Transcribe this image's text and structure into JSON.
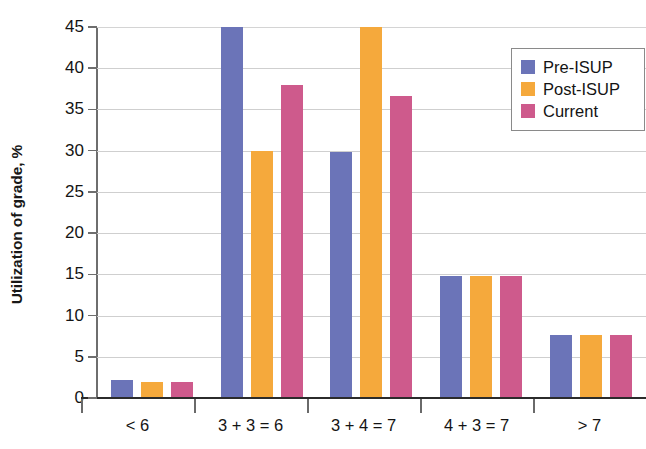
{
  "chart_data": {
    "type": "bar",
    "title": "",
    "xlabel": "",
    "ylabel": "Utilization of grade, %",
    "categories": [
      "< 6",
      "3 + 3 = 6",
      "3 + 4 = 7",
      "4 + 3 = 7",
      "> 7"
    ],
    "series": [
      {
        "name": "Pre-ISUP",
        "color": "#6b74b8",
        "values": [
          2.2,
          45.0,
          29.9,
          14.8,
          7.7
        ]
      },
      {
        "name": "Post-ISUP",
        "color": "#f5a93c",
        "values": [
          1.9,
          30.0,
          45.0,
          14.8,
          7.7
        ]
      },
      {
        "name": "Current",
        "color": "#ce5a8c",
        "values": [
          1.9,
          38.0,
          36.6,
          14.8,
          7.7
        ]
      }
    ],
    "ylim": [
      0,
      45
    ],
    "yticks": [
      0,
      5,
      10,
      15,
      20,
      25,
      30,
      35,
      40,
      45
    ],
    "ytick_labels": [
      "0",
      "5",
      "10",
      "15",
      "20",
      "25",
      "30",
      "35",
      "40",
      "45"
    ],
    "grid": true,
    "grid_axis": "y",
    "legend_position": "upper right",
    "legend_entries": [
      "Pre-ISUP",
      "Post-ISUP",
      "Current"
    ]
  },
  "colors": {
    "pre_isup": "#6b74b8",
    "post_isup": "#f5a93c",
    "current": "#ce5a8c",
    "gridline": "#cfcfcf",
    "axis": "#2b2b2b",
    "text": "#141414",
    "background": "#ffffff"
  }
}
